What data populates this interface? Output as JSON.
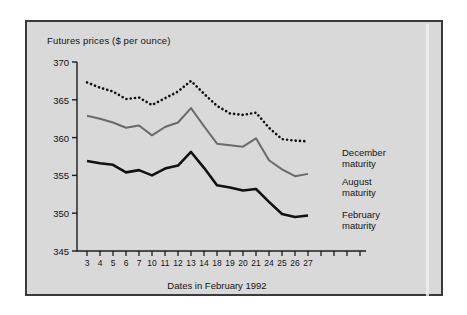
{
  "chart_data": {
    "type": "line",
    "title": "Futures prices ($ per ounce)",
    "xlabel": "Dates in February 1992",
    "ylabel": "",
    "ylim": [
      345,
      370
    ],
    "yticks": [
      345,
      350,
      355,
      360,
      365,
      370
    ],
    "grid": false,
    "legend_position": "right-inline",
    "categories": [
      "3",
      "4",
      "5",
      "6",
      "7",
      "10",
      "11",
      "12",
      "13",
      "14",
      "18",
      "19",
      "20",
      "21",
      "24",
      "25",
      "26",
      "27"
    ],
    "extra_unlabeled_ticks": 4,
    "series": [
      {
        "name": "December maturity",
        "style": "dotted",
        "color": "#101010",
        "values": [
          367.3,
          366.6,
          366.1,
          365.1,
          365.3,
          364.3,
          365.2,
          366.1,
          367.5,
          365.8,
          364.2,
          363.2,
          363.0,
          363.3,
          361.3,
          359.8,
          359.6,
          359.5
        ]
      },
      {
        "name": "August maturity",
        "style": "solid",
        "color": "#6a6a6a",
        "values": [
          362.9,
          362.5,
          362.0,
          361.3,
          361.6,
          360.3,
          361.4,
          362.0,
          363.9,
          361.5,
          359.2,
          359.0,
          358.8,
          359.9,
          357.0,
          355.8,
          354.9,
          355.2
        ]
      },
      {
        "name": "February maturity",
        "style": "solid",
        "color": "#111111",
        "values": [
          356.9,
          356.6,
          356.4,
          355.4,
          355.7,
          355.0,
          355.9,
          356.3,
          358.1,
          356.0,
          353.7,
          353.4,
          353.0,
          353.2,
          351.5,
          349.9,
          349.5,
          349.7
        ]
      }
    ]
  },
  "legend": {
    "items": [
      {
        "line1": "December",
        "line2": "maturity"
      },
      {
        "line1": "August",
        "line2": "maturity"
      },
      {
        "line1": "February",
        "line2": "maturity"
      }
    ]
  }
}
